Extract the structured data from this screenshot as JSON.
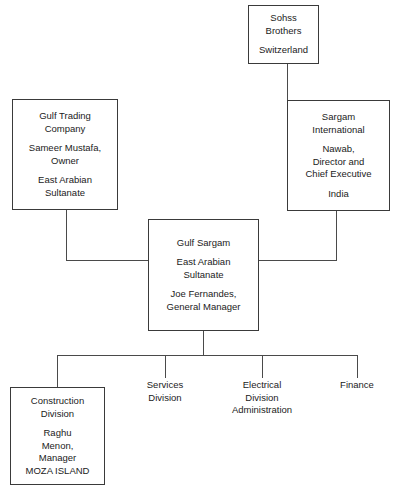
{
  "diagram": {
    "line_color": "#4a4a4a",
    "border_color": "#3a3a3a",
    "text_color": "#1b1b1b",
    "background": "#ffffff"
  },
  "nodes": {
    "sohss_brothers": {
      "name": "Sohss Brothers",
      "lines": [
        "Sohss",
        "Brothers"
      ],
      "location": [
        "Switzerland"
      ]
    },
    "gulf_trading": {
      "name": "Gulf Trading Company",
      "lines": [
        "Gulf Trading",
        "Company"
      ],
      "person": [
        "Sameer Mustafa,",
        "Owner"
      ],
      "location": [
        "East Arabian",
        "Sultanate"
      ]
    },
    "sargam_international": {
      "name": "Sargam International",
      "lines": [
        "Sargam",
        "International"
      ],
      "person": [
        "Nawab,",
        "Director and",
        "Chief Executive"
      ],
      "location": [
        "India"
      ]
    },
    "gulf_sargam": {
      "name": "Gulf Sargam",
      "lines": [
        "Gulf Sargam"
      ],
      "location": [
        "East Arabian",
        "Sultanate"
      ],
      "person": [
        "Joe Fernandes,",
        "General Manager"
      ]
    },
    "construction_division": {
      "name": "Construction Division",
      "lines": [
        "Construction",
        "Division"
      ],
      "person": [
        "Raghu",
        "Menon,",
        "Manager",
        "MOZA ISLAND"
      ]
    },
    "services_division": {
      "name": "Services Division",
      "lines": [
        "Services",
        "Division"
      ]
    },
    "electrical_division": {
      "name": "Electrical Division Administration",
      "lines": [
        "Electrical",
        "Division",
        "Administration"
      ]
    },
    "finance": {
      "name": "Finance",
      "lines": [
        "Finance"
      ]
    }
  }
}
